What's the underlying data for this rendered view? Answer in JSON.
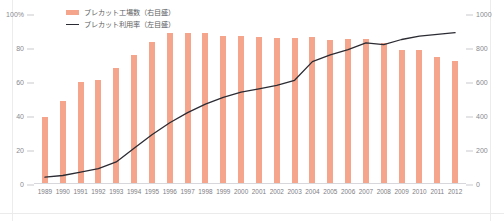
{
  "legend": {
    "items": [
      {
        "label": "プレカット工場数（右目盛）",
        "marker": "bar-swatch",
        "color": "#f4a58c"
      },
      {
        "label": "プレカット利用率（左目盛）",
        "marker": "line-swatch",
        "color": "#2b2b33"
      }
    ]
  },
  "axes": {
    "left_ticks": [
      "100%",
      "80",
      "60",
      "40",
      "20",
      "0"
    ],
    "right_ticks": [
      "1000",
      "800",
      "600",
      "400",
      "200",
      "0"
    ]
  },
  "chart_data": {
    "type": "bar",
    "title": "",
    "subtitle": "",
    "xlabel": "",
    "ylabel": "",
    "grid": false,
    "legend_position": "top-left",
    "categories": [
      "1989",
      "1990",
      "1991",
      "1992",
      "1993",
      "1994",
      "1995",
      "1996",
      "1997",
      "1998",
      "1999",
      "2000",
      "2001",
      "2002",
      "2003",
      "2004",
      "2005",
      "2006",
      "2007",
      "2008",
      "2009",
      "2010",
      "2011",
      "2012"
    ],
    "series": [
      {
        "name": "プレカット工場数（右目盛）",
        "type": "bar",
        "axis": "right",
        "color": "#f4a58c",
        "ylim": [
          0,
          1000
        ],
        "ylabel": "工場数",
        "values": [
          395,
          490,
          600,
          610,
          680,
          760,
          835,
          890,
          890,
          890,
          870,
          870,
          865,
          860,
          860,
          865,
          845,
          855,
          855,
          830,
          790,
          790,
          745,
          725
        ]
      },
      {
        "name": "プレカット利用率（左目盛）",
        "type": "line",
        "axis": "left",
        "color": "#2b2b33",
        "ylim": [
          0,
          100
        ],
        "ylabel": "利用率(%)",
        "values": [
          4,
          5,
          7,
          9,
          13,
          21,
          29,
          36,
          42,
          47,
          51,
          54,
          56,
          58,
          61,
          72,
          76,
          79,
          83,
          82,
          85,
          87,
          88,
          89
        ]
      }
    ]
  }
}
